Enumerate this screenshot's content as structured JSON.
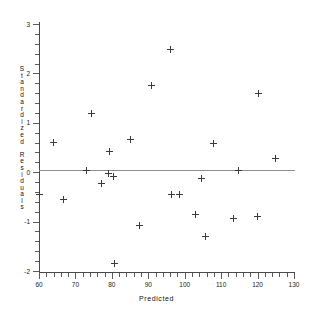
{
  "chart_data": {
    "type": "scatter",
    "title": "",
    "xlabel": "Predicted",
    "ylabel": "Standardized Residuals",
    "xlim": [
      60,
      130
    ],
    "ylim": [
      -2,
      3
    ],
    "xticks": [
      60,
      70,
      80,
      90,
      100,
      110,
      120,
      130
    ],
    "yticks": [
      3,
      2,
      1,
      0,
      -1,
      -2
    ],
    "grid": false,
    "legend": null,
    "reference_line": {
      "y": 0,
      "orientation": "horizontal"
    },
    "marker": "plus",
    "series": [
      {
        "name": "residuals",
        "points": [
          {
            "x": 60.0,
            "y": -0.46
          },
          {
            "x": 64.0,
            "y": 0.6
          },
          {
            "x": 66.8,
            "y": -0.56
          },
          {
            "x": 73.0,
            "y": 0.04
          },
          {
            "x": 74.5,
            "y": 1.19
          },
          {
            "x": 77.2,
            "y": -0.23
          },
          {
            "x": 79.0,
            "y": -0.02
          },
          {
            "x": 79.4,
            "y": 0.42
          },
          {
            "x": 80.5,
            "y": -0.09
          },
          {
            "x": 80.8,
            "y": -1.84
          },
          {
            "x": 85.0,
            "y": 0.66
          },
          {
            "x": 87.5,
            "y": -1.08
          },
          {
            "x": 90.8,
            "y": 1.76
          },
          {
            "x": 96.2,
            "y": 2.48
          },
          {
            "x": 96.5,
            "y": -0.46
          },
          {
            "x": 98.5,
            "y": -0.46
          },
          {
            "x": 103.0,
            "y": -0.86
          },
          {
            "x": 104.5,
            "y": -0.13
          },
          {
            "x": 105.8,
            "y": -1.31
          },
          {
            "x": 108.0,
            "y": 0.59
          },
          {
            "x": 113.5,
            "y": -0.94
          },
          {
            "x": 114.8,
            "y": 0.04
          },
          {
            "x": 120.0,
            "y": -0.9
          },
          {
            "x": 120.2,
            "y": 1.59
          },
          {
            "x": 125.0,
            "y": 0.27
          }
        ]
      }
    ]
  },
  "axes": {
    "x_title": "Predicted",
    "y_title_chars": [
      "S",
      "t",
      "a",
      "n",
      "d",
      "a",
      "r",
      "d",
      "i",
      "z",
      "e",
      "d",
      "",
      "R",
      "e",
      "s",
      "i",
      "d",
      "u",
      "a",
      "l",
      "s"
    ],
    "x_tick_labels": [
      "60",
      "70",
      "80",
      "90",
      "100",
      "110",
      "120",
      "130"
    ],
    "y_tick_labels": [
      "3",
      "2",
      "1",
      "0",
      "-1",
      "-2"
    ]
  },
  "colors": {
    "background": "#ffffff",
    "axis": "#4a4a4a",
    "reference_line": "#8e8e8e",
    "marker": "#3a3a3a",
    "text": "#111111"
  }
}
